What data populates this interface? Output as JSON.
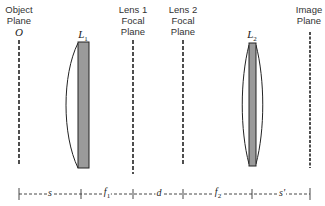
{
  "planes": [
    {
      "id": "object",
      "label": "Object\nPlane",
      "symbol": "O",
      "x": 19
    },
    {
      "id": "lens1-focal",
      "label": "Lens 1\nFocal\nPlane",
      "x": 133
    },
    {
      "id": "lens2-focal",
      "label": "Lens 2\nFocal\nPlane",
      "x": 183
    },
    {
      "id": "image",
      "label": "Image\nPlane",
      "x": 310
    }
  ],
  "lenses": [
    {
      "id": "L1",
      "label": "L",
      "subscript": "1",
      "x": 82,
      "type": "plano-convex"
    },
    {
      "id": "L2",
      "label": "L",
      "subscript": "2",
      "x": 252,
      "type": "biconvex"
    }
  ],
  "scale": {
    "segments": [
      {
        "label": "s",
        "sub": ""
      },
      {
        "label": "f",
        "sub": "1"
      },
      {
        "label": "d",
        "sub": ""
      },
      {
        "label": "f",
        "sub": "2"
      },
      {
        "label": "s'",
        "sub": ""
      }
    ],
    "ticks_x": [
      19,
      81,
      133,
      183,
      252,
      310
    ]
  },
  "colors": {
    "lens_fill": "#9a9a9a",
    "line": "#222222"
  }
}
